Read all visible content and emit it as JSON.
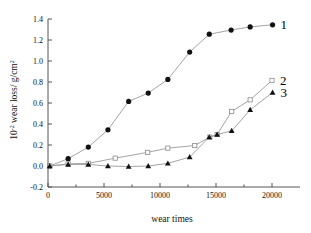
{
  "chart_data": {
    "type": "line",
    "title": "",
    "xlabel": "wear times",
    "ylabel": "10-2 wear loss/ g/cm2",
    "ylabel_parts": {
      "base": "10",
      "exp": "-2",
      "mid": " wear loss/ g/cm",
      "exp2": "2"
    },
    "xlim": [
      0,
      22500
    ],
    "ylim": [
      -0.2,
      1.4
    ],
    "xticks": [
      0,
      5000,
      10000,
      15000,
      20000
    ],
    "xtick_labels": [
      "0",
      "5000",
      "10000",
      "15000",
      "20000"
    ],
    "yticks": [
      -0.2,
      0.0,
      0.2,
      0.4,
      0.6,
      0.8,
      1.0,
      1.2,
      1.4
    ],
    "ytick_labels": [
      "-0.2",
      "0.0",
      "0.2",
      "0.4",
      "0.6",
      "0.8",
      "1.0",
      "1.2",
      "1.4"
    ],
    "grid": false,
    "legend_position": "right-inline",
    "series": [
      {
        "name": "1",
        "label": "1",
        "marker": "filled-circle",
        "color": "#111111",
        "points": [
          [
            150,
            0.0
          ],
          [
            1800,
            0.07
          ],
          [
            3600,
            0.18
          ],
          [
            5350,
            0.345
          ],
          [
            7200,
            0.615
          ],
          [
            8950,
            0.695
          ],
          [
            10700,
            0.825
          ],
          [
            12650,
            1.085
          ],
          [
            14400,
            1.255
          ],
          [
            16350,
            1.295
          ],
          [
            18050,
            1.325
          ],
          [
            20050,
            1.345
          ]
        ]
      },
      {
        "name": "2",
        "label": "2",
        "marker": "open-square",
        "color": "#8a8a8a",
        "points": [
          [
            150,
            0.0
          ],
          [
            1800,
            0.02
          ],
          [
            3600,
            0.025
          ],
          [
            6000,
            0.075
          ],
          [
            8900,
            0.13
          ],
          [
            10700,
            0.17
          ],
          [
            13100,
            0.195
          ],
          [
            14450,
            0.275
          ],
          [
            15100,
            0.3
          ],
          [
            16400,
            0.52
          ],
          [
            18050,
            0.63
          ],
          [
            20000,
            0.815
          ]
        ]
      },
      {
        "name": "3",
        "label": "3",
        "marker": "filled-triangle",
        "color": "#111111",
        "points": [
          [
            150,
            0.0
          ],
          [
            1800,
            0.015
          ],
          [
            3600,
            0.015
          ],
          [
            5350,
            0.0
          ],
          [
            7200,
            -0.005
          ],
          [
            8950,
            0.0
          ],
          [
            10700,
            0.025
          ],
          [
            12650,
            0.085
          ],
          [
            14400,
            0.275
          ],
          [
            15100,
            0.3
          ],
          [
            16400,
            0.335
          ],
          [
            18050,
            0.535
          ],
          [
            20050,
            0.7
          ]
        ]
      }
    ]
  }
}
